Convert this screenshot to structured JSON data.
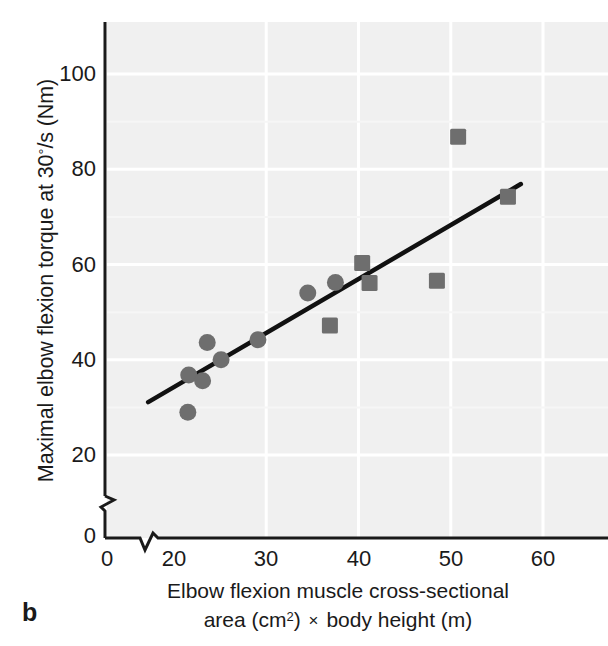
{
  "panel": {
    "label": "b"
  },
  "axes": {
    "y": {
      "title_parts": {
        "pre": "Maximal elbow flexion torque at 30",
        "deg": "°",
        "post": "/s (Nm)"
      },
      "title": "Maximal elbow flexion torque at 30°/s (Nm)",
      "ticks": [
        {
          "value": 100,
          "label": "100"
        },
        {
          "value": 80,
          "label": "80"
        },
        {
          "value": 60,
          "label": "60"
        },
        {
          "value": 40,
          "label": "40"
        },
        {
          "value": 20,
          "label": "20"
        },
        {
          "value": 0,
          "label": "0"
        }
      ],
      "break_between": [
        0,
        20
      ],
      "origin_label": "0"
    },
    "x": {
      "title_line1": "Elbow flexion muscle cross-sectional",
      "title_line2_pre": "area (cm",
      "title_line2_sup": "2",
      "title_line2_mid": ") ",
      "title_line2_times": "×",
      "title_line2_post": " body height (m)",
      "title": "Elbow flexion muscle cross-sectional area (cm2) × body height (m)",
      "ticks": [
        {
          "value": 0,
          "label": "0"
        },
        {
          "value": 20,
          "label": "20"
        },
        {
          "value": 30,
          "label": "30"
        },
        {
          "value": 40,
          "label": "40"
        },
        {
          "value": 50,
          "label": "50"
        },
        {
          "value": 60,
          "label": "60"
        }
      ],
      "break_between": [
        0,
        20
      ]
    }
  },
  "colors": {
    "plot_background": "#f0f0f0",
    "gridline": "#ffffff",
    "axis": "#1a1a1a",
    "marker": "#6e6e6e",
    "trendline": "#111111",
    "text": "#1a1a1a"
  },
  "chart_data": {
    "type": "scatter",
    "title": "",
    "xlabel": "Elbow flexion muscle cross-sectional area (cm2) × body height (m)",
    "ylabel": "Maximal elbow flexion torque at 30°/s (Nm)",
    "xlim": [
      16,
      64
    ],
    "ylim": [
      14,
      110
    ],
    "xticks": [
      20,
      30,
      40,
      50,
      60
    ],
    "yticks": [
      20,
      40,
      60,
      80,
      100
    ],
    "grid": true,
    "grid_color": "#ffffff",
    "axis_breaks": {
      "x": [
        0,
        20
      ],
      "y": [
        0,
        20
      ]
    },
    "legend": "none",
    "series": [
      {
        "name": "circles",
        "marker": "circle",
        "color": "#6e6e6e",
        "points": [
          {
            "x": 21.5,
            "y": 29.0
          },
          {
            "x": 21.6,
            "y": 36.8
          },
          {
            "x": 23.1,
            "y": 35.6
          },
          {
            "x": 23.6,
            "y": 43.6
          },
          {
            "x": 25.1,
            "y": 40.0
          },
          {
            "x": 29.1,
            "y": 44.2
          },
          {
            "x": 34.5,
            "y": 54.0
          },
          {
            "x": 37.5,
            "y": 56.2
          }
        ]
      },
      {
        "name": "squares",
        "marker": "square",
        "color": "#6e6e6e",
        "points": [
          {
            "x": 36.9,
            "y": 47.2
          },
          {
            "x": 40.4,
            "y": 60.3
          },
          {
            "x": 41.2,
            "y": 56.1
          },
          {
            "x": 48.5,
            "y": 56.6
          },
          {
            "x": 50.8,
            "y": 86.8
          },
          {
            "x": 56.2,
            "y": 74.2
          }
        ]
      }
    ],
    "trendline": {
      "x0": 17.2,
      "y0": 31.1,
      "x1": 57.6,
      "y1": 76.9
    }
  }
}
